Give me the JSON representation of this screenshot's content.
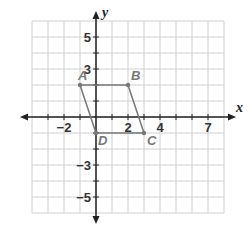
{
  "graph": {
    "x_axis_label": "x",
    "y_axis_label": "y",
    "x_ticks": [
      {
        "value": -2,
        "label": "−2"
      },
      {
        "value": 2,
        "label": "2"
      },
      {
        "value": 4,
        "label": "4"
      },
      {
        "value": 7,
        "label": "7"
      }
    ],
    "y_ticks": [
      {
        "value": 5,
        "label": "5"
      },
      {
        "value": 3,
        "label": "3"
      },
      {
        "value": -3,
        "label": "−3"
      },
      {
        "value": -5,
        "label": "−5"
      }
    ],
    "xlim": [
      -4,
      8
    ],
    "ylim": [
      -6,
      6
    ],
    "grid": true,
    "colors": {
      "grid": "#d0d0d0",
      "axis": "#222222",
      "shape": "#777777"
    }
  },
  "shape": {
    "name": "parallelogram ABCD",
    "points": [
      {
        "label": "A",
        "x": -1,
        "y": 2
      },
      {
        "label": "B",
        "x": 2,
        "y": 2
      },
      {
        "label": "C",
        "x": 3,
        "y": -1
      },
      {
        "label": "D",
        "x": 0,
        "y": -1
      }
    ]
  }
}
